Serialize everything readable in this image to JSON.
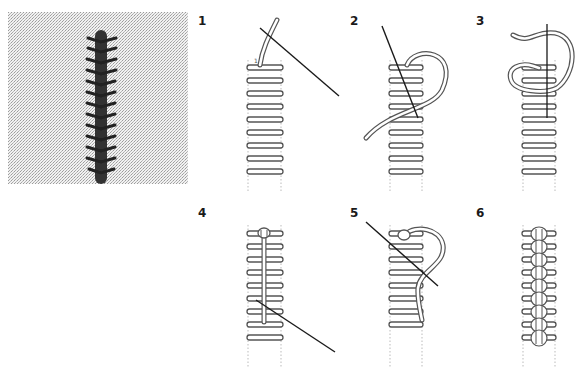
{
  "figure": {
    "photo": {
      "description": "Embroidered sample of braided/chain stitch on linen fabric"
    },
    "steps": [
      {
        "number": "1",
        "start_point_label": "1"
      },
      {
        "number": "2"
      },
      {
        "number": "3"
      },
      {
        "number": "4"
      },
      {
        "number": "5"
      },
      {
        "number": "6"
      }
    ],
    "colors": {
      "thread_outline": "#555555",
      "needle": "#1a1a1a",
      "guide_lines": "#aaaaaa",
      "fabric": "#e6e6e6",
      "stitch": "#2a2a2a"
    }
  }
}
